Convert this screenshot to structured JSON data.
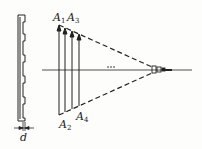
{
  "diagram": {
    "type": "grating-diffraction-focusing",
    "grating_label": "d",
    "arrow_labels_top": [
      "A1",
      "A3"
    ],
    "arrow_labels_bottom": [
      "A2",
      "A4"
    ],
    "ellipsis": "...",
    "labels": {
      "A1": {
        "base": "A",
        "sub": "1"
      },
      "A2": {
        "base": "A",
        "sub": "2"
      },
      "A3": {
        "base": "A",
        "sub": "3"
      },
      "A4": {
        "base": "A",
        "sub": "4"
      },
      "d": "d"
    },
    "colors": {
      "line": "#222222",
      "background": "#fdfdfb"
    }
  }
}
